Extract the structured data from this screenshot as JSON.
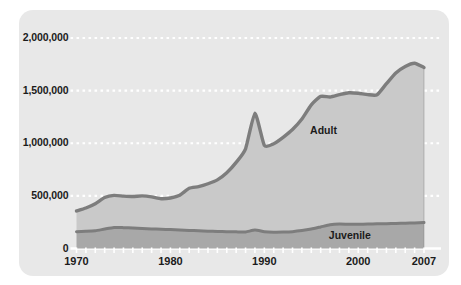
{
  "chart_data": {
    "type": "area",
    "stacked": true,
    "title": "",
    "subtitle": "",
    "xlabel": "",
    "ylabel": "",
    "xlim": [
      1970,
      2007
    ],
    "ylim": [
      0,
      2000000
    ],
    "grid": true,
    "grid_style": "dotted-white-horizontal",
    "legend_position": "inline-annotation",
    "y_ticks": [
      0,
      500000,
      1000000,
      1500000,
      2000000
    ],
    "y_tick_labels": [
      "0",
      "500,000",
      "1,000,000",
      "1,500,000",
      "2,000,000"
    ],
    "x_ticks": [
      1970,
      1980,
      1990,
      2000,
      2007
    ],
    "x_tick_labels": [
      "1970",
      "1980",
      "1990",
      "2000",
      "2007"
    ],
    "x": [
      1970,
      1971,
      1972,
      1973,
      1974,
      1975,
      1976,
      1977,
      1978,
      1979,
      1980,
      1981,
      1982,
      1983,
      1984,
      1985,
      1986,
      1987,
      1988,
      1989,
      1990,
      1991,
      1992,
      1993,
      1994,
      1995,
      1996,
      1997,
      1998,
      1999,
      2000,
      2001,
      2002,
      2003,
      2004,
      2005,
      2006,
      2007
    ],
    "series": [
      {
        "name": "Juvenile",
        "color": "#a8a8a8",
        "stroke": "#7d7d7d",
        "values": [
          160000,
          163000,
          168000,
          185000,
          200000,
          198000,
          194000,
          190000,
          186000,
          183000,
          180000,
          176000,
          172000,
          168000,
          165000,
          162000,
          160000,
          158000,
          157000,
          175000,
          160000,
          155000,
          156000,
          160000,
          170000,
          185000,
          205000,
          225000,
          232000,
          230000,
          230000,
          232000,
          234000,
          236000,
          238000,
          240000,
          243000,
          246000
        ]
      },
      {
        "name": "Adult",
        "color": "#c9c9c9",
        "stroke": "#7d7d7d",
        "values": [
          197000,
          222000,
          257000,
          300000,
          305000,
          300000,
          300000,
          310000,
          305000,
          290000,
          300000,
          330000,
          400000,
          420000,
          450000,
          490000,
          560000,
          660000,
          790000,
          1110000,
          820000,
          840000,
          900000,
          970000,
          1060000,
          1180000,
          1240000,
          1215000,
          1230000,
          1250000,
          1245000,
          1230000,
          1226000,
          1330000,
          1430000,
          1490000,
          1517000,
          1474000
        ]
      }
    ],
    "totals": [
      357000,
      385000,
      425000,
      485000,
      505000,
      498000,
      494000,
      500000,
      491000,
      473000,
      480000,
      506000,
      572000,
      588000,
      615000,
      652000,
      720000,
      818000,
      947000,
      1285000,
      980000,
      995000,
      1056000,
      1130000,
      1230000,
      1365000,
      1445000,
      1440000,
      1462000,
      1480000,
      1475000,
      1462000,
      1460000,
      1566000,
      1668000,
      1730000,
      1760000,
      1720000
    ],
    "annotations": [
      {
        "text": "Adult",
        "x": 1997,
        "y": 1120000
      },
      {
        "text": "Juvenile",
        "x": 1999,
        "y": 115000
      }
    ],
    "colors": {
      "card_background": "#e8e8e8",
      "adult_fill": "#c9c9c9",
      "juvenile_fill": "#a8a8a8",
      "line_stroke": "#7d7d7d",
      "gridline": "#ffffff",
      "text": "#1b1b1b"
    }
  }
}
